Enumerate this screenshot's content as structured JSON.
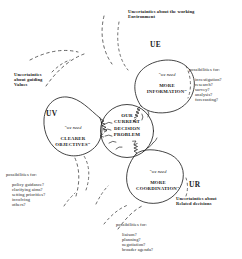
{
  "diagram": {
    "style": {
      "ink": "#222222",
      "paper": "#ffffff",
      "dash_ink": "#555555"
    },
    "core": {
      "code": "",
      "text": "OUR\nCURRENT\nDECISION\nPROBLEM"
    },
    "lobes": [
      {
        "id": "UE",
        "code": "UE",
        "quote_lead": "\"we need",
        "quote_body": "MORE\nINFORMATION\"",
        "caption": "Uncertainties about the working\nEnvironment",
        "possibilities_head": "possibilities for:",
        "possibilities_items": "investigation?\nresearch?\nsurvey?\nanalysis?\nforecasting?"
      },
      {
        "id": "UV",
        "code": "UV",
        "quote_lead": "\"we need",
        "quote_body": "CLEARER\nOBJECTIVES\"",
        "caption": "Uncertainties\nabout guiding\nValues",
        "possibilities_head": "possibilities for:",
        "possibilities_items": "policy guidance?\nclarifying aims?\nsetting priorities?\ninvolving\nothers?"
      },
      {
        "id": "UR",
        "code": "UR",
        "quote_lead": "\"we need",
        "quote_body": "MORE\nCOORDINATION\"",
        "caption": "Uncertainties about\nRelated decisions",
        "possibilities_head": "possibilities for:",
        "possibilities_items": "liaison?\nplanning?\nnegotiation?\nbroader agenda?"
      }
    ]
  }
}
